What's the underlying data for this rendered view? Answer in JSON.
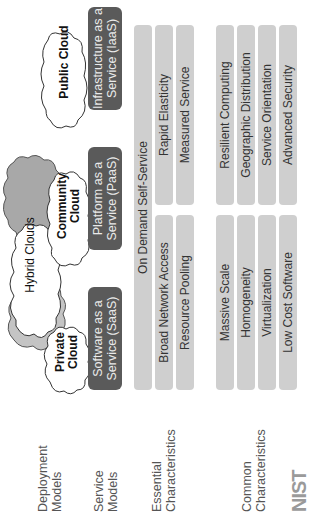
{
  "row_labels": {
    "deployment": [
      "Deployment",
      "Models"
    ],
    "service": [
      "Service",
      "Models"
    ],
    "essential": [
      "Essential",
      "Characteristics"
    ],
    "common": [
      "Common",
      "Characteristics"
    ]
  },
  "deployment_models": {
    "private": [
      "Private",
      "Cloud"
    ],
    "community": [
      "Community",
      "Cloud"
    ],
    "public": "Public Cloud",
    "hybrid": "Hybrid Clouds"
  },
  "service_models": [
    [
      "Software as a",
      "Service (SaaS)"
    ],
    [
      "Platform as a",
      "Service (PaaS)"
    ],
    [
      "Infrastructure as a",
      "Service (IaaS)"
    ]
  ],
  "essential_characteristics": {
    "full": "On Demand Self-Service",
    "left": [
      "Broad Network Access",
      "Resource Pooling"
    ],
    "right": [
      "Rapid Elasticity",
      "Measured Service"
    ]
  },
  "common_characteristics": {
    "left": [
      "Massive Scale",
      "Homogeneity",
      "Virtualization",
      "Low Cost Software"
    ],
    "right": [
      "Resilient Computing",
      "Geographic Distribution",
      "Service Orientation",
      "Advanced Security"
    ]
  },
  "logo": "NIST",
  "colors": {
    "service_box": "#5a5a5a",
    "bar": "#cfcfcf",
    "hybrid_cloud_back": "#a8a8a8",
    "hybrid_cloud_mid": "#c4c4c4"
  }
}
